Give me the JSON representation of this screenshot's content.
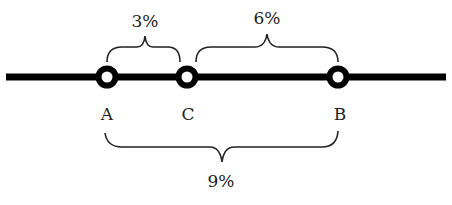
{
  "diagram": {
    "points": [
      {
        "label": "A",
        "x": 107
      },
      {
        "label": "C",
        "x": 187
      },
      {
        "label": "B",
        "x": 338
      }
    ],
    "segments": [
      {
        "from": "A",
        "to": "C",
        "label": "3%",
        "position": "above"
      },
      {
        "from": "C",
        "to": "B",
        "label": "6%",
        "position": "above"
      },
      {
        "from": "A",
        "to": "B",
        "label": "9%",
        "position": "below"
      }
    ],
    "colors": {
      "line": "#000000",
      "text": "#222222",
      "background": "#ffffff"
    }
  }
}
